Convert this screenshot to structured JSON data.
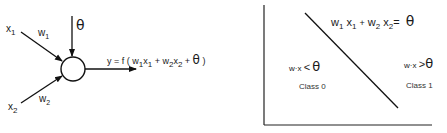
{
  "perceptron": {
    "input1": {
      "var": "x",
      "sub": "1"
    },
    "input2": {
      "var": "x",
      "sub": "2"
    },
    "weight1": {
      "var": "w",
      "sub": "1"
    },
    "weight2": {
      "var": "w",
      "sub": "2"
    },
    "threshold": "θ",
    "output_formula": {
      "prefix": "y = f ( ",
      "t1w": "w",
      "t1ws": "1",
      "t1x": "x",
      "t1xs": "1",
      "plus1": " + ",
      "t2w": "w",
      "t2ws": "2",
      "t2x": "x",
      "t2xs": "2",
      "plus2": " + ",
      "theta": "θ",
      "suffix": " )"
    }
  },
  "decision_plot": {
    "boundary_equation": {
      "w1": "w",
      "w1s": "1",
      "x1": "x",
      "x1s": "1",
      "plus": "+",
      "w2": "w",
      "w2s": "2",
      "x2": "x",
      "x2s": "2",
      "eq": "=",
      "theta": "θ"
    },
    "region_left": {
      "condition_prefix": "w·x",
      "op": "<",
      "theta": "θ",
      "class_label": "Class 0"
    },
    "region_right": {
      "condition_prefix": "w·x",
      "op": ">",
      "theta": "θ",
      "class_label": "Class 1"
    }
  }
}
